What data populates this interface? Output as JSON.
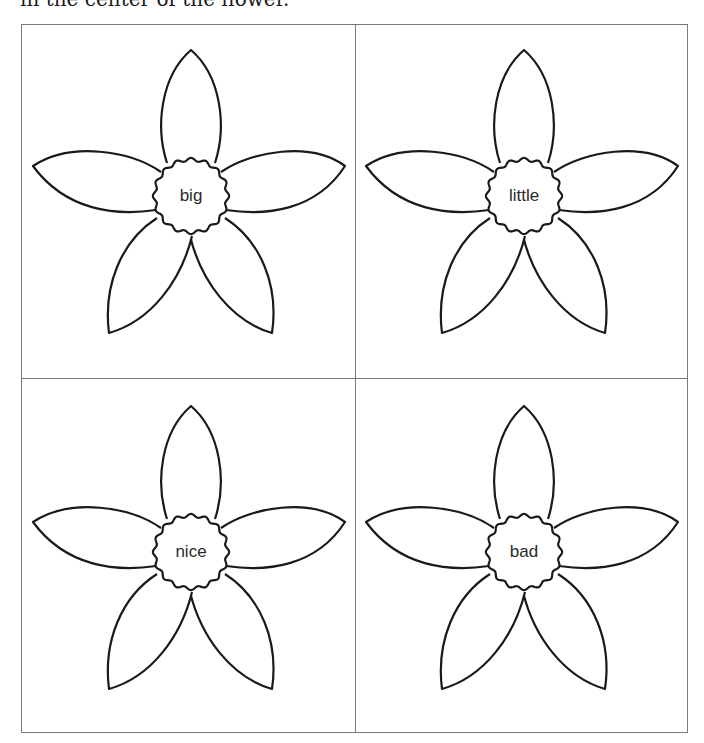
{
  "caption": "in the center of the flower.",
  "cards": [
    {
      "word": "big"
    },
    {
      "word": "little"
    },
    {
      "word": "nice"
    },
    {
      "word": "bad"
    }
  ],
  "colors": {
    "outline": "#1a1a1a",
    "grid": "#7a7a7a",
    "background": "#ffffff"
  }
}
